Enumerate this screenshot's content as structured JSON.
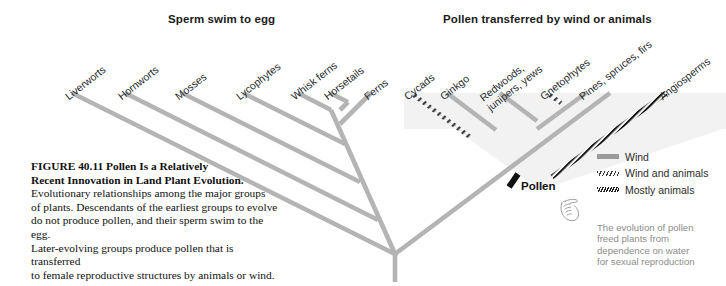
{
  "figure": {
    "number": "FIGURE 40.11",
    "title": "Pollen Is a Relatively Recent Innovation in Land Plant Evolution.",
    "title_line1": "FIGURE 40.11   Pollen Is a Relatively",
    "title_line2": "Recent Innovation in Land Plant Evolution.",
    "caption_lines": [
      "Evolutionary relationships among the major groups",
      "of plants. Descendants of the earliest groups to evolve",
      "do not produce pollen, and their sperm swim to the egg.",
      "Later-evolving groups produce pollen that is transferred",
      "to female reproductive structures by animals or wind."
    ]
  },
  "headers": {
    "left": "Sperm swim to egg",
    "right": "Pollen transferred by wind or animals"
  },
  "tree": {
    "root_label": "Pollen",
    "synapomorphy": "Pollen",
    "taxa": [
      {
        "id": "liverworts",
        "label": "Liverworts",
        "style": "plain",
        "pollen": false
      },
      {
        "id": "hornworts",
        "label": "Hornworts",
        "style": "plain",
        "pollen": false
      },
      {
        "id": "mosses",
        "label": "Mosses",
        "style": "plain",
        "pollen": false
      },
      {
        "id": "lycophytes",
        "label": "Lycophytes",
        "style": "plain",
        "pollen": false
      },
      {
        "id": "whisk-ferns",
        "label": "Whisk ferns",
        "style": "plain",
        "pollen": false
      },
      {
        "id": "horsetails",
        "label": "Horsetails",
        "style": "plain",
        "pollen": false
      },
      {
        "id": "ferns",
        "label": "Ferns",
        "style": "plain",
        "pollen": false
      },
      {
        "id": "cycads",
        "label": "Cycads",
        "style": "wind-animals",
        "pollen": true
      },
      {
        "id": "ginkgo",
        "label": "Ginkgo",
        "style": "wind",
        "pollen": true
      },
      {
        "id": "redwoods",
        "label": "Redwoods,\njunipers, yews",
        "style": "wind",
        "pollen": true
      },
      {
        "id": "gnetophytes",
        "label": "Gnetophytes",
        "style": "wind-animals",
        "pollen": true
      },
      {
        "id": "pines",
        "label": "Pines, spruces, firs",
        "style": "wind",
        "pollen": true
      },
      {
        "id": "angiosperms",
        "label": "Angiosperms",
        "style": "animals",
        "pollen": true
      }
    ]
  },
  "legend": {
    "items": [
      {
        "id": "wind",
        "label": "Wind",
        "style": "wind"
      },
      {
        "id": "windanimals",
        "label": "Wind and animals",
        "style": "wind-animals"
      },
      {
        "id": "animals",
        "label": "Mostly animals",
        "style": "animals"
      }
    ]
  },
  "annotation": {
    "lines": [
      "The evolution of pollen",
      "freed plants from",
      "dependence on water",
      "for sexual reproduction"
    ]
  },
  "colors": {
    "branch": "#b4b4b4",
    "clade_shade": "#f2f2f2",
    "dark_hatch": "#1c1c1c",
    "text": "#111111",
    "annotation_text": "#8d8d8d"
  }
}
